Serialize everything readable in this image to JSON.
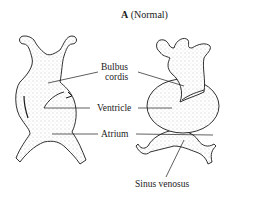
{
  "figure": {
    "panel_letter": "A",
    "panel_caption": "(Normal)"
  },
  "labels": {
    "bulbus_cordis_line1": "Bulbus",
    "bulbus_cordis_line2": "cordis",
    "ventricle": "Ventricle",
    "atrium": "Atrium",
    "sinus_venosus": "Sinus venosus"
  },
  "colors": {
    "ink": "#1a1a1a",
    "stipple": "#8a8a8a",
    "background": "#ffffff"
  }
}
